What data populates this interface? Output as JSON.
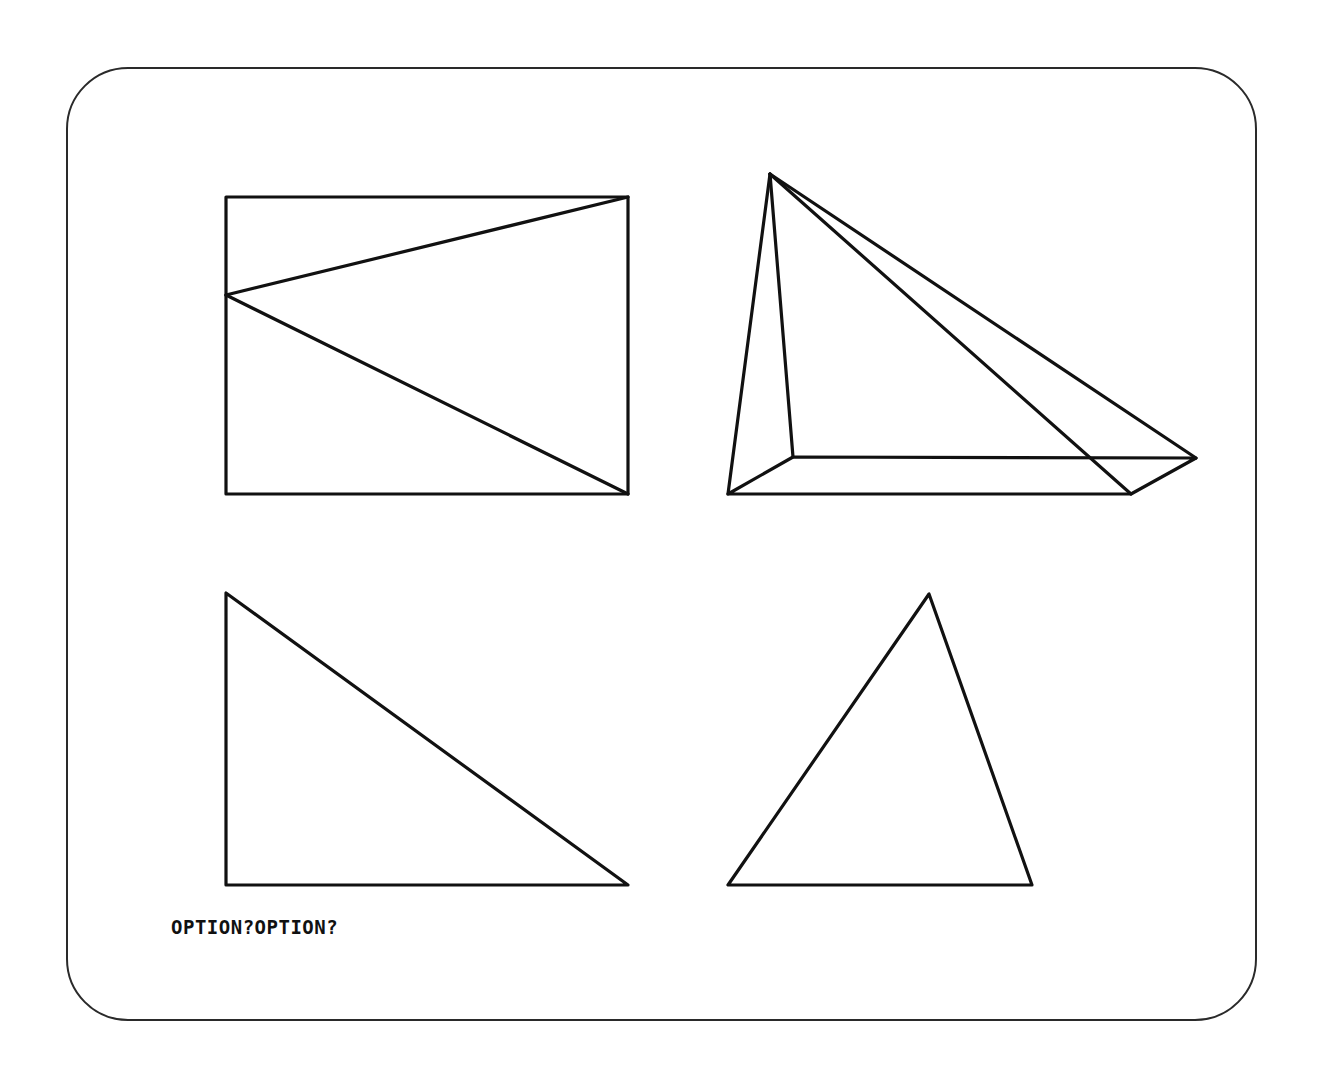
{
  "screen": {
    "background": "#ffffff",
    "stroke_color": "#111111",
    "prompt_text": "OPTION?OPTION?"
  },
  "figures": [
    {
      "name": "rectangle-with-triangle",
      "type": "polyline-set",
      "points": {
        "rect": [
          [
            226,
            197
          ],
          [
            628,
            197
          ],
          [
            628,
            494
          ],
          [
            226,
            494
          ]
        ],
        "apex": [
          226,
          295
        ],
        "diagonal_to_top_right": [
          [
            226,
            295
          ],
          [
            628,
            197
          ]
        ],
        "diagonal_to_bottom_right": [
          [
            226,
            295
          ],
          [
            628,
            494
          ]
        ]
      }
    },
    {
      "name": "pyramid",
      "type": "wireframe",
      "apex": [
        770,
        174
      ],
      "base": [
        [
          728,
          494
        ],
        [
          793,
          457
        ],
        [
          1196,
          458
        ],
        [
          1131,
          494
        ]
      ]
    },
    {
      "name": "right-triangle",
      "type": "polygon",
      "points": [
        [
          226,
          593
        ],
        [
          226,
          885
        ],
        [
          628,
          885
        ]
      ]
    },
    {
      "name": "scalene-triangle",
      "type": "polygon",
      "points": [
        [
          929,
          594
        ],
        [
          728,
          885
        ],
        [
          1032,
          885
        ]
      ]
    }
  ]
}
